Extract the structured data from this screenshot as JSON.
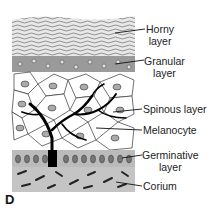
{
  "figure": {
    "panel_letter": "D",
    "labels": [
      {
        "id": "horny",
        "line1": "Horny",
        "line2": "layer"
      },
      {
        "id": "granular",
        "line1": "Granular",
        "line2": "layer"
      },
      {
        "id": "spinous",
        "line1": "Spinous layer"
      },
      {
        "id": "melanocyte",
        "line1": "Melanocyte"
      },
      {
        "id": "germinative",
        "line1": "Germinative",
        "line2": "layer"
      },
      {
        "id": "corium",
        "line1": "Corium"
      }
    ]
  }
}
